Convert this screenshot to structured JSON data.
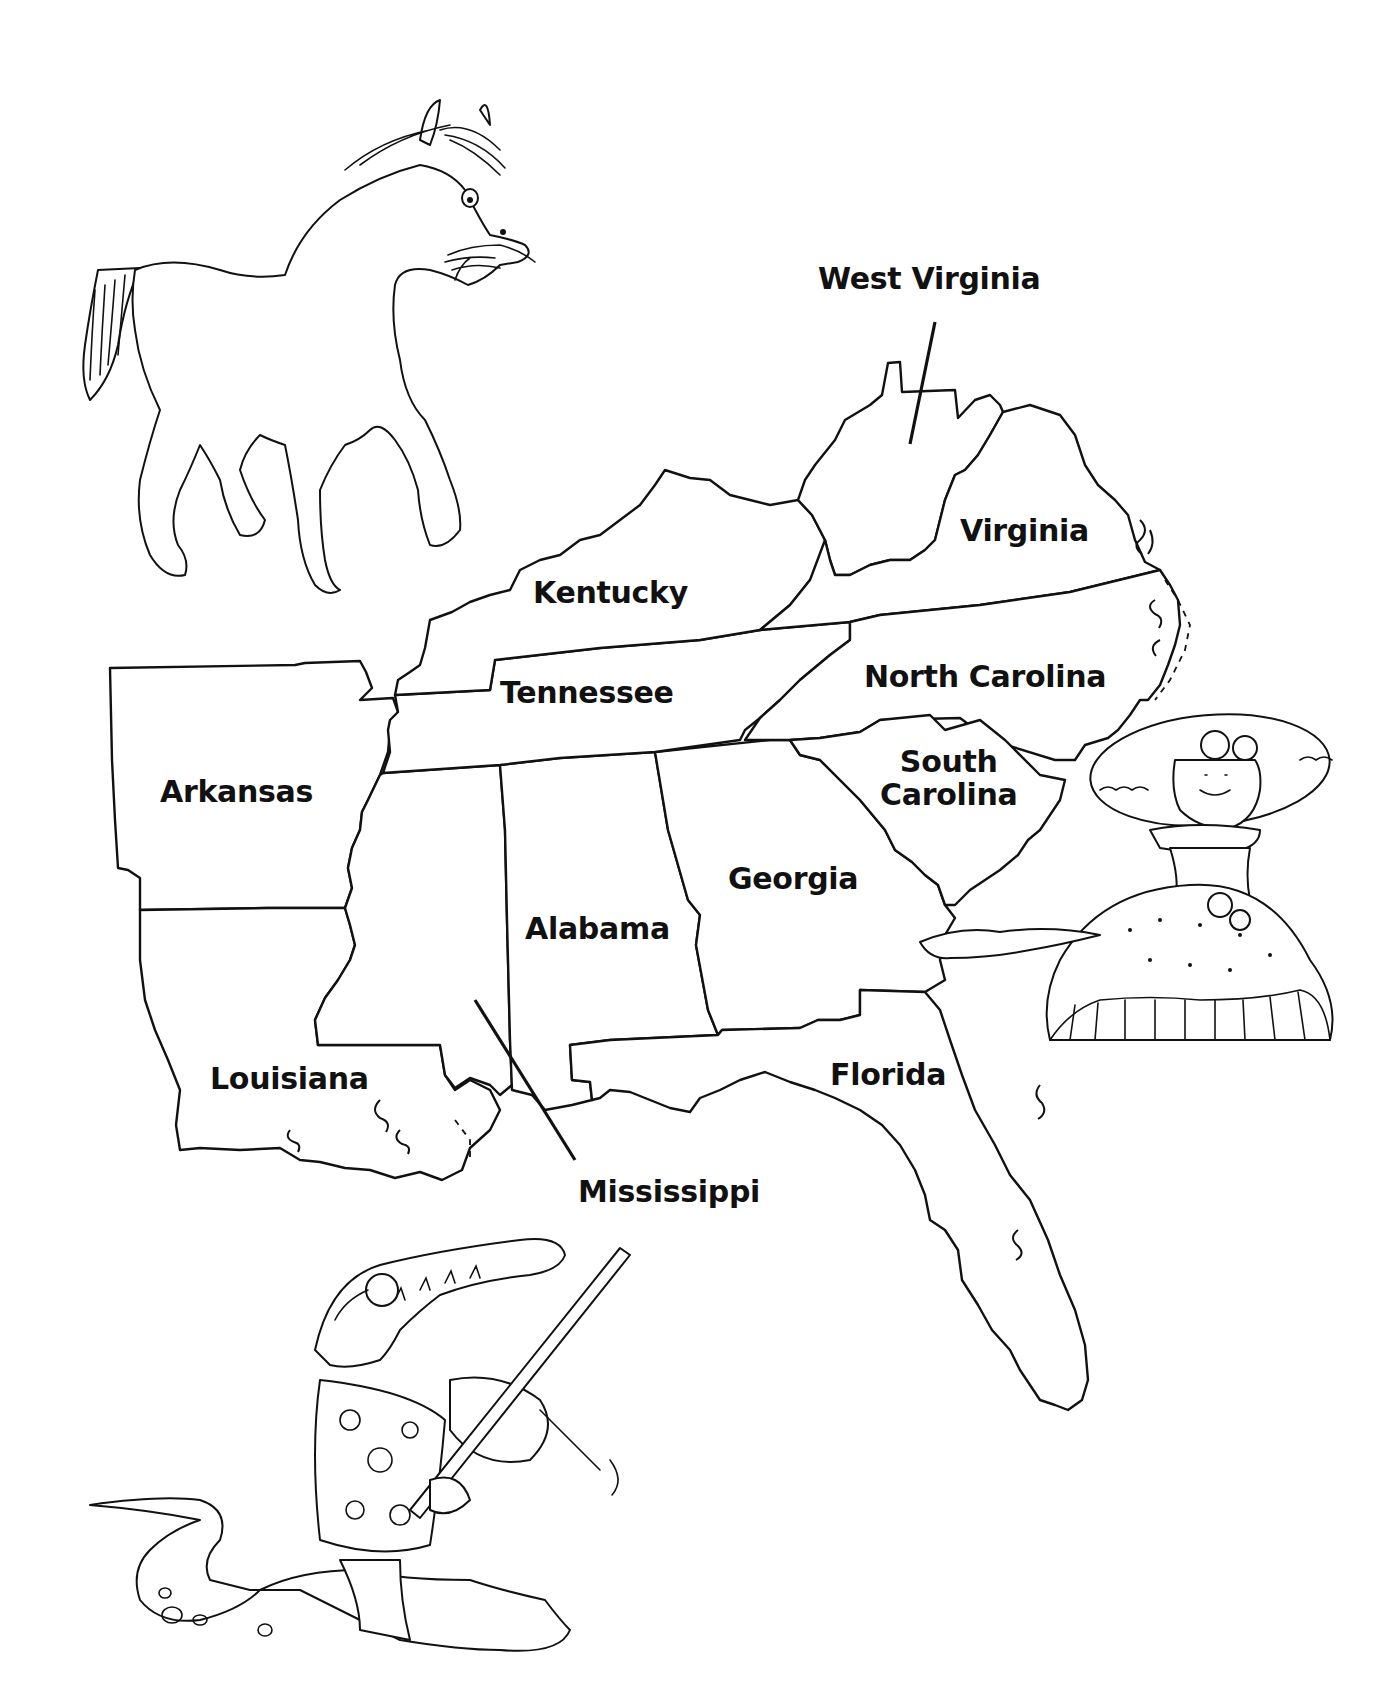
{
  "map": {
    "type": "coloring-page",
    "region": "Southeastern United States",
    "line_color": "#111111",
    "background": "#ffffff",
    "states": [
      {
        "id": "west-virginia",
        "label": "West Virginia"
      },
      {
        "id": "virginia",
        "label": "Virginia"
      },
      {
        "id": "kentucky",
        "label": "Kentucky"
      },
      {
        "id": "north-carolina",
        "label": "North Carolina"
      },
      {
        "id": "tennessee",
        "label": "Tennessee"
      },
      {
        "id": "south-carolina",
        "label_line1": "South",
        "label_line2": "Carolina"
      },
      {
        "id": "arkansas",
        "label": "Arkansas"
      },
      {
        "id": "georgia",
        "label": "Georgia"
      },
      {
        "id": "alabama",
        "label": "Alabama"
      },
      {
        "id": "louisiana",
        "label": "Louisiana"
      },
      {
        "id": "florida",
        "label": "Florida"
      },
      {
        "id": "mississippi",
        "label": "Mississippi"
      }
    ],
    "illustrations": [
      {
        "id": "horse",
        "description": "horse eating hay"
      },
      {
        "id": "southern-belle",
        "description": "Southern belle in hoop dress and wide hat"
      },
      {
        "id": "alligator",
        "description": "alligator in Hawaiian shirt and sunglasses playing fiddle"
      }
    ]
  }
}
